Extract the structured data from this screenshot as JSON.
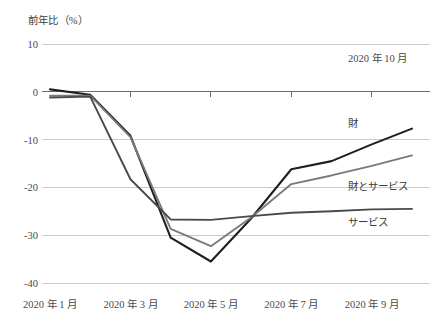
{
  "chart_data": {
    "type": "line",
    "title": "",
    "subtitle": "",
    "ylabel": "前年比（%）",
    "xlabel": "",
    "annotation": "2020 年 10 月",
    "grid": true,
    "legend_position": "right-inline",
    "ylim": [
      -40,
      10
    ],
    "yticks": [
      10,
      0,
      -10,
      -20,
      -30,
      -40
    ],
    "ytick_labels": [
      "10",
      "0",
      "-10",
      "-20",
      "-30",
      "-40"
    ],
    "x": [
      "2020-01",
      "2020-02",
      "2020-03",
      "2020-04",
      "2020-05",
      "2020-06",
      "2020-07",
      "2020-08",
      "2020-09",
      "2020-10"
    ],
    "xtick_labels": [
      "2020 年 1 月",
      "2020 年 3 月",
      "2020 年 5 月",
      "2020 年 7 月",
      "2020 年 9 月"
    ],
    "xtick_indices": [
      0,
      2,
      4,
      6,
      8
    ],
    "series": [
      {
        "name": "財",
        "color": "#1f1f1f",
        "values": [
          0.5,
          -0.6,
          -9.2,
          -30.5,
          -35.5,
          -26.5,
          -16.2,
          -14.5,
          -11.0,
          -7.7
        ]
      },
      {
        "name": "財とサービス",
        "color": "#7a7a7a",
        "values": [
          -0.8,
          -0.8,
          -9.5,
          -28.7,
          -32.3,
          -26.3,
          -19.3,
          -17.5,
          -15.5,
          -13.3
        ]
      },
      {
        "name": "サービス",
        "color": "#4a4a4a",
        "values": [
          -1.2,
          -1.0,
          -18.3,
          -26.7,
          -26.8,
          -26.0,
          -25.3,
          -25.0,
          -24.6,
          -24.5
        ]
      }
    ]
  },
  "labels": {
    "series_goods": "財",
    "series_goods_services": "財とサービス",
    "series_services": "サービス"
  }
}
